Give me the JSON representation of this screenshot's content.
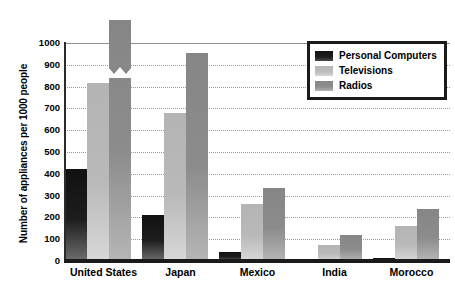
{
  "chart_data": {
    "type": "bar",
    "title": "",
    "xlabel": "",
    "ylabel": "Number of appliances per 1000 people",
    "ylim": [
      0,
      1000
    ],
    "ytick_step": 100,
    "yticks": [
      1000,
      900,
      800,
      700,
      600,
      500,
      400,
      300,
      200,
      100,
      0
    ],
    "grid": true,
    "legend_position": "upper right",
    "categories": [
      "United States",
      "Japan",
      "Mexico",
      "India",
      "Morocco"
    ],
    "series": [
      {
        "name": "Personal Computers",
        "color": "#1a1a1a",
        "values": [
          420,
          212,
          40,
          6,
          12
        ]
      },
      {
        "name": "Televisions",
        "color": "#b8b8b8",
        "values": [
          815,
          680,
          260,
          75,
          160
        ]
      },
      {
        "name": "Radios",
        "color": "#8a8a8a",
        "values": [
          2115,
          955,
          335,
          118,
          240
        ],
        "broken_axis_bars": [
          {
            "category": "United States",
            "value": 2115,
            "label": "2115",
            "note": "bar exceeds axis maximum; drawn with axis break"
          }
        ]
      }
    ],
    "annotations": [
      {
        "text": "2115",
        "for": "United States / Radios"
      }
    ]
  },
  "legend": {
    "items": [
      {
        "label": "Personal Computers",
        "swatch": "pc"
      },
      {
        "label": "Televisions",
        "swatch": "tv"
      },
      {
        "label": "Radios",
        "swatch": "radio"
      }
    ]
  }
}
